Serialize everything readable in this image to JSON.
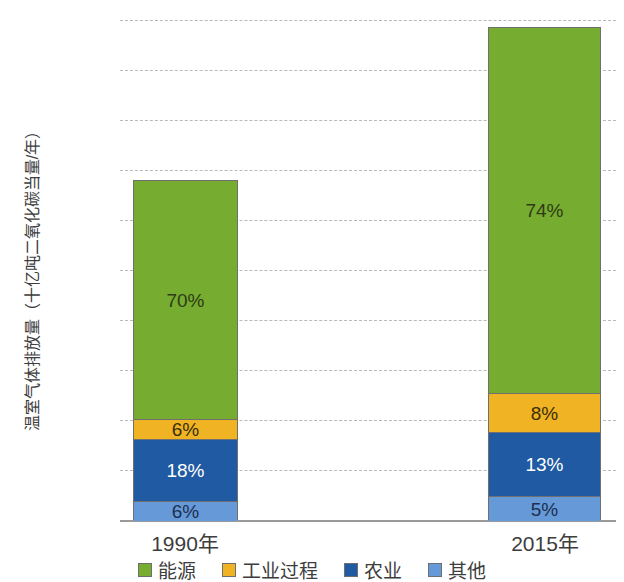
{
  "chart_data": {
    "type": "bar",
    "subtype": "stacked-bar-100-percent-annotated",
    "title": "",
    "xlabel": "",
    "ylabel": "温室气体排放量（十亿吨二氧化碳当量/年）",
    "categories": [
      "1990年",
      "2015年"
    ],
    "ylim": [
      0,
      50
    ],
    "yticks": [
      0,
      5,
      10,
      15,
      20,
      25,
      30,
      35,
      40,
      45,
      50
    ],
    "ytick_labels": [
      "0",
      "5",
      "10",
      "15",
      "20",
      "25",
      "30",
      "35",
      "40",
      "45",
      "50"
    ],
    "grid": true,
    "grid_style": "dashed-horizontal",
    "legend_position": "bottom",
    "totals": [
      34,
      49.3
    ],
    "series": [
      {
        "name": "能源",
        "color": "#76ac2f",
        "values": [
          23.8,
          36.5
        ],
        "percent_labels": [
          "70%",
          "74%"
        ],
        "label_color": "#2f3b18"
      },
      {
        "name": "工业过程",
        "color": "#f0b323",
        "values": [
          2.04,
          3.94
        ],
        "percent_labels": [
          "6%",
          "8%"
        ],
        "label_color": "#3a2e07"
      },
      {
        "name": "农业",
        "color": "#1f5aa3",
        "values": [
          6.12,
          6.41
        ],
        "percent_labels": [
          "18%",
          "13%"
        ],
        "label_color": "#ffffff"
      },
      {
        "name": "其他",
        "color": "#6699d8",
        "values": [
          2.04,
          2.47
        ],
        "percent_labels": [
          "6%",
          "5%"
        ],
        "label_color": "#1c2f4e"
      }
    ]
  },
  "axis": {
    "y_title": "温室气体排放量（十亿吨二氧化碳当量/年）",
    "ticks": [
      "50",
      "45",
      "40",
      "35",
      "30",
      "25",
      "20",
      "15",
      "10",
      "5",
      "0"
    ]
  },
  "legend": {
    "items": [
      {
        "label": "能源",
        "color": "#76ac2f"
      },
      {
        "label": "工业过程",
        "color": "#f0b323"
      },
      {
        "label": "农业",
        "color": "#1f5aa3"
      },
      {
        "label": "其他",
        "color": "#6699d8"
      }
    ]
  },
  "bars": [
    {
      "category": "1990年",
      "segments": [
        {
          "name": "能源",
          "percent_label": "70%"
        },
        {
          "name": "工业过程",
          "percent_label": "6%"
        },
        {
          "name": "农业",
          "percent_label": "18%"
        },
        {
          "name": "其他",
          "percent_label": "6%"
        }
      ]
    },
    {
      "category": "2015年",
      "segments": [
        {
          "name": "能源",
          "percent_label": "74%"
        },
        {
          "name": "工业过程",
          "percent_label": "8%"
        },
        {
          "name": "农业",
          "percent_label": "13%"
        },
        {
          "name": "其他",
          "percent_label": "5%"
        }
      ]
    }
  ]
}
